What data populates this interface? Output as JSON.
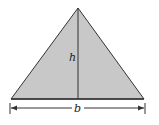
{
  "diagram": {
    "shape": "triangle",
    "fill_color": "#c8c8c8",
    "stroke_color": "#333333",
    "labels": {
      "height": "h",
      "base": "b"
    }
  }
}
